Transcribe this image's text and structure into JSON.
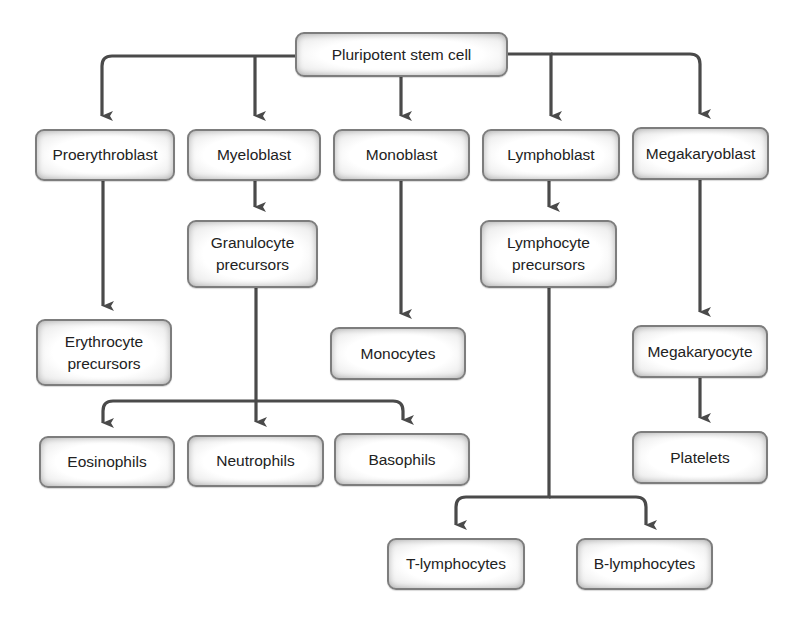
{
  "diagram": {
    "colors": {
      "line": "#4a4a4a",
      "box_border": "#7d7d7d",
      "text": "#222222",
      "background": "#ffffff"
    },
    "nodes": {
      "stem": {
        "label": "Pluripotent stem cell"
      },
      "proerythroblast": {
        "label": "Proerythroblast"
      },
      "myeloblast": {
        "label": "Myeloblast"
      },
      "monoblast": {
        "label": "Monoblast"
      },
      "lymphoblast": {
        "label": "Lymphoblast"
      },
      "megakaryoblast": {
        "label": "Megakaryoblast"
      },
      "granulocyte_precursors": {
        "label": "Granulocyte\nprecursors"
      },
      "lymphocyte_precursors": {
        "label": "Lymphocyte\nprecursors"
      },
      "erythrocyte_precursors": {
        "label": "Erythrocyte\nprecursors"
      },
      "monocytes": {
        "label": "Monocytes"
      },
      "megakaryocyte": {
        "label": "Megakaryocyte"
      },
      "eosinophils": {
        "label": "Eosinophils"
      },
      "neutrophils": {
        "label": "Neutrophils"
      },
      "basophils": {
        "label": "Basophils"
      },
      "platelets": {
        "label": "Platelets"
      },
      "t_lymphocytes": {
        "label": "T-lymphocytes"
      },
      "b_lymphocytes": {
        "label": "B-lymphocytes"
      }
    },
    "edges": [
      {
        "from": "Pluripotent stem cell",
        "to": "Proerythroblast"
      },
      {
        "from": "Pluripotent stem cell",
        "to": "Myeloblast"
      },
      {
        "from": "Pluripotent stem cell",
        "to": "Monoblast"
      },
      {
        "from": "Pluripotent stem cell",
        "to": "Lymphoblast"
      },
      {
        "from": "Pluripotent stem cell",
        "to": "Megakaryoblast"
      },
      {
        "from": "Proerythroblast",
        "to": "Erythrocyte precursors"
      },
      {
        "from": "Myeloblast",
        "to": "Granulocyte precursors"
      },
      {
        "from": "Granulocyte precursors",
        "to": "Eosinophils"
      },
      {
        "from": "Granulocyte precursors",
        "to": "Neutrophils"
      },
      {
        "from": "Granulocyte precursors",
        "to": "Basophils"
      },
      {
        "from": "Monoblast",
        "to": "Monocytes"
      },
      {
        "from": "Lymphoblast",
        "to": "Lymphocyte precursors"
      },
      {
        "from": "Lymphocyte precursors",
        "to": "T-lymphocytes"
      },
      {
        "from": "Lymphocyte precursors",
        "to": "B-lymphocytes"
      },
      {
        "from": "Megakaryoblast",
        "to": "Megakaryocyte"
      },
      {
        "from": "Megakaryocyte",
        "to": "Platelets"
      }
    ]
  }
}
